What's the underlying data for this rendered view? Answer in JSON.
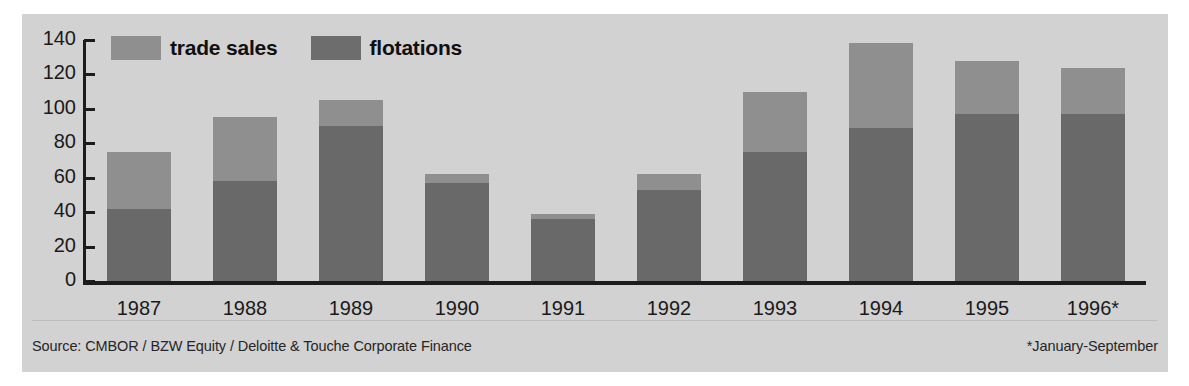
{
  "chart_data": {
    "type": "bar",
    "stacked": true,
    "title": "",
    "subtitle": "",
    "xlabel": "",
    "ylabel": "",
    "categories": [
      "1987",
      "1988",
      "1989",
      "1990",
      "1991",
      "1992",
      "1993",
      "1994",
      "1995",
      "1996*"
    ],
    "series": [
      {
        "name": "flotations",
        "color": "#696969",
        "values": [
          42,
          58,
          90,
          57,
          36,
          53,
          75,
          89,
          97,
          97
        ]
      },
      {
        "name": "trade sales",
        "color": "#8f8f8f",
        "values": [
          33,
          37,
          15,
          5,
          3,
          9,
          35,
          49,
          31,
          27
        ]
      }
    ],
    "totals": [
      75,
      95,
      105,
      62,
      39,
      62,
      110,
      138,
      128,
      124
    ],
    "ylim": [
      0,
      140
    ],
    "yticks": [
      0,
      20,
      40,
      60,
      80,
      100,
      120,
      140
    ],
    "ytick_labels": [
      "0",
      "20",
      "40",
      "60",
      "80",
      "100",
      "120",
      "140"
    ],
    "grid": false,
    "legend_position": "top-left"
  },
  "legend": {
    "items": [
      {
        "label": "trade sales",
        "swatch": "trade-sales-swatch",
        "color": "#8f8f8f"
      },
      {
        "label": "flotations",
        "swatch": "flotations-swatch",
        "color": "#6d6d6d"
      }
    ]
  },
  "footer": {
    "source": "Source: CMBOR / BZW Equity / Deloitte & Touche Corporate Finance",
    "note": "*January-September"
  },
  "colors": {
    "panel_background": "#d2d2d2",
    "page_background": "#ffffff",
    "axis": "#1c1c1c",
    "text": "#1a1a1a",
    "flotations": "#696969",
    "trade_sales": "#8f8f8f"
  }
}
